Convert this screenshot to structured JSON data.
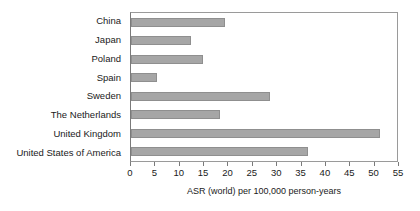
{
  "chart_data": {
    "type": "bar",
    "orientation": "horizontal",
    "title": "",
    "subtitle": "",
    "xlabel": "ASR (world) per 100,000 person-years",
    "ylabel": "",
    "categories": [
      "China",
      "Japan",
      "Poland",
      "Spain",
      "Sweden",
      "The Netherlands",
      "United Kingdom",
      "United States of America"
    ],
    "values": [
      19.2,
      12.4,
      14.8,
      5.4,
      28.6,
      18.2,
      51.2,
      36.4
    ],
    "xlim": [
      0,
      55
    ],
    "xticks": [
      0,
      5,
      10,
      15,
      20,
      25,
      30,
      35,
      40,
      45,
      50,
      55
    ],
    "xtick_labels": [
      "0",
      "5",
      "10",
      "15",
      "20",
      "25",
      "30",
      "35",
      "40",
      "45",
      "50",
      "55"
    ],
    "grid": false,
    "legend": null,
    "bar_color": "#a6a6a6",
    "bar_edge_color": "#8f8f8f",
    "frame_color": "#9a9a9a",
    "background": "#ffffff"
  }
}
